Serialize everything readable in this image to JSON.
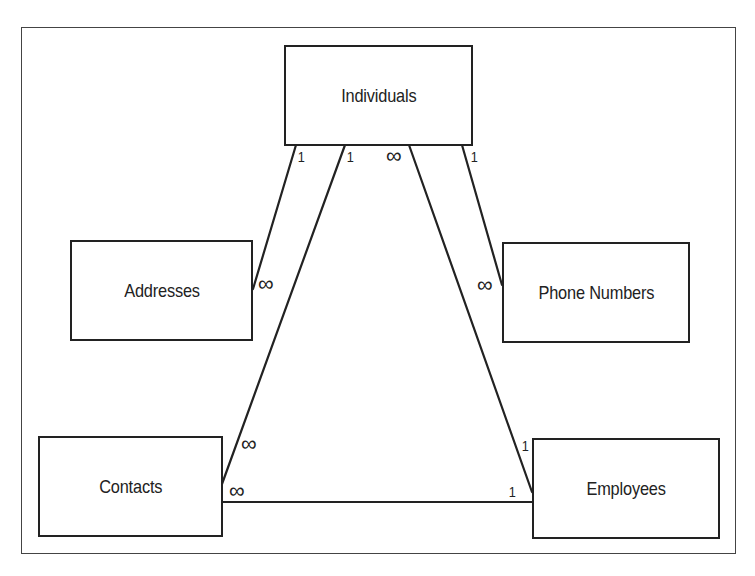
{
  "diagram": {
    "type": "entity-relationship",
    "entities": [
      {
        "id": "individuals",
        "label": "Individuals"
      },
      {
        "id": "addresses",
        "label": "Addresses"
      },
      {
        "id": "phone_numbers",
        "label": "Phone Numbers"
      },
      {
        "id": "contacts",
        "label": "Contacts"
      },
      {
        "id": "employees",
        "label": "Employees"
      }
    ],
    "relationships": [
      {
        "from": "individuals",
        "to": "addresses",
        "from_cardinality": "1",
        "to_cardinality": "∞"
      },
      {
        "from": "individuals",
        "to": "contacts",
        "from_cardinality": "1",
        "to_cardinality": "∞"
      },
      {
        "from": "individuals",
        "to": "employees",
        "from_cardinality": "∞",
        "to_cardinality": "1"
      },
      {
        "from": "individuals",
        "to": "phone_numbers",
        "from_cardinality": "1",
        "to_cardinality": "∞"
      },
      {
        "from": "employees",
        "to": "contacts",
        "from_cardinality": "1",
        "to_cardinality": "∞"
      }
    ],
    "cardinality_labels": {
      "ind_addr_one": "1",
      "ind_cont_one": "1",
      "ind_emp_many": "∞",
      "ind_phone_one": "1",
      "addr_many": "∞",
      "phone_many": "∞",
      "cont_ind_many": "∞",
      "cont_emp_many": "∞",
      "emp_ind_one": "1",
      "emp_cont_one": "1"
    },
    "colors": {
      "stroke": "#222222",
      "background": "#ffffff"
    }
  }
}
